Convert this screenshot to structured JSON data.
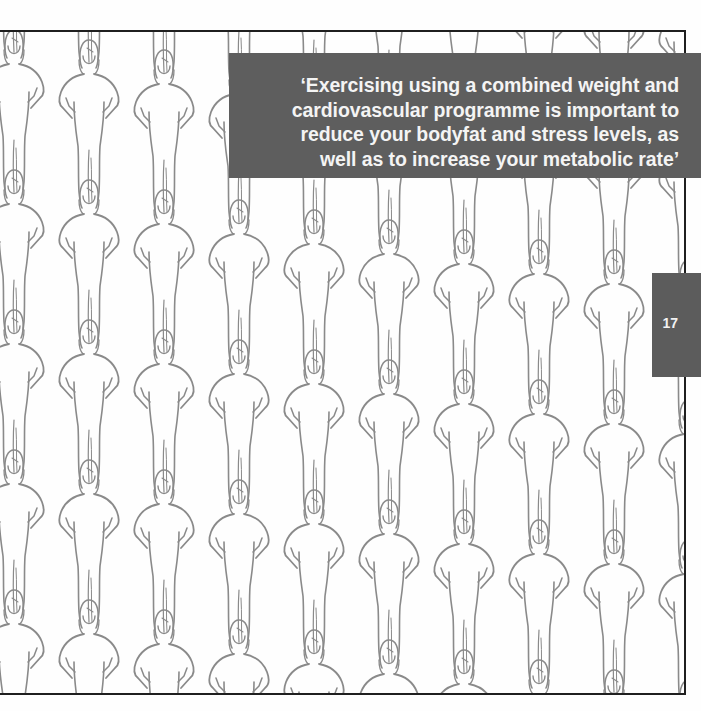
{
  "page": {
    "page_number": "17",
    "quote": {
      "lines": [
        "‘Exercising using a combined weight and",
        "cardiovascular programme is important to",
        "reduce your bodyfat and stress levels, as",
        "well as to increase your metabolic rate’"
      ]
    },
    "illustration": {
      "subject": "repeating pattern of standing female figures with hands on hips",
      "figure_icon": "woman-standing-hands-on-hips-icon",
      "line_color": "#8a8a8a",
      "columns_spacing_px": 75,
      "column_step_down_px": 10,
      "row_spacing_px": 140
    },
    "colors": {
      "quote_box": "#5e5e5e",
      "quote_text": "#f4f4f4",
      "page_tab": "#5c5c5c",
      "page_tab_text": "#f2f2f2",
      "frame_border": "#1f1f1f",
      "background": "#fefefe"
    }
  }
}
